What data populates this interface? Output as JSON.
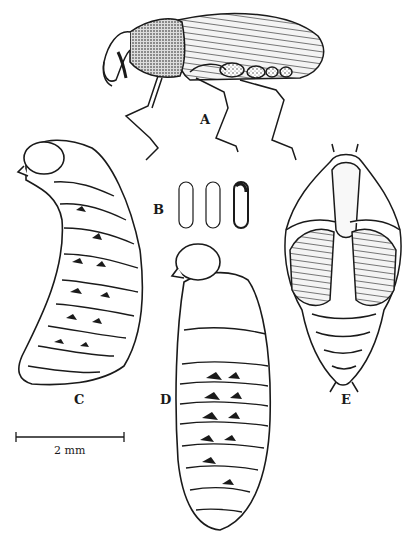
{
  "figure": {
    "panels": [
      {
        "id": "A",
        "label": "A",
        "subject": "adult weevil, lateral view"
      },
      {
        "id": "B",
        "label": "B",
        "subject": "eggs (three)"
      },
      {
        "id": "C",
        "label": "C",
        "subject": "larva, lateral view"
      },
      {
        "id": "D",
        "label": "D",
        "subject": "larva, lateral view"
      },
      {
        "id": "E",
        "label": "E",
        "subject": "pupa, ventral view"
      }
    ],
    "scale_bar": {
      "label": "2 mm"
    },
    "colors": {
      "ink": "#1a1a1a",
      "paper": "#ffffff"
    }
  }
}
